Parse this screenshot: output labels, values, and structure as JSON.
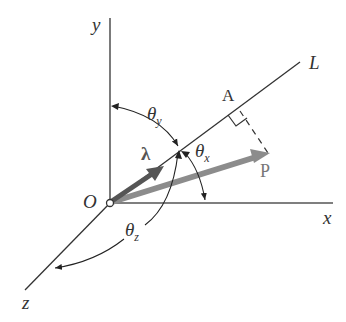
{
  "diagram": {
    "axes": {
      "x": "x",
      "y": "y",
      "z": "z"
    },
    "origin": "O",
    "line": "L",
    "point_a": "A",
    "vector_p": "P",
    "unit_vector": "λ",
    "angles": {
      "theta_x": {
        "symbol": "θ",
        "sub": "x"
      },
      "theta_y": {
        "symbol": "θ",
        "sub": "y"
      },
      "theta_z": {
        "symbol": "θ",
        "sub": "z"
      }
    },
    "colors": {
      "line": "#333333",
      "unit_vector": "#555555",
      "vector_p": "#8c8c8c",
      "background": "#ffffff"
    }
  }
}
